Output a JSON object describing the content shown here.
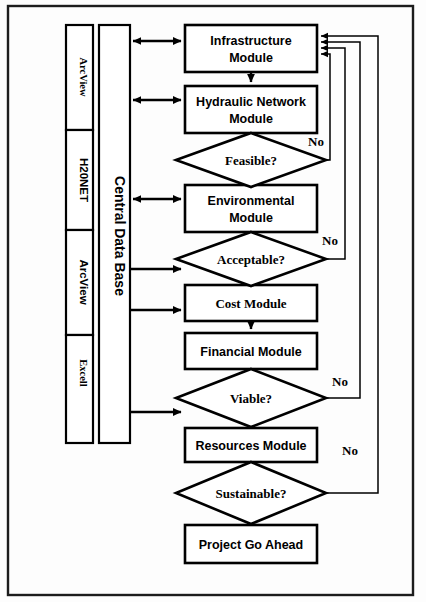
{
  "diagram": {
    "background": "#fdfdfd",
    "border_color": "#1c1c1c",
    "shape_fill": "#ffffff",
    "shape_stroke": "#000000"
  },
  "data_store": {
    "label": "Central Data Base",
    "software": [
      {
        "name": "ArcView"
      },
      {
        "name": "H20NET"
      },
      {
        "name": "ArcView"
      },
      {
        "name": "Excell"
      }
    ]
  },
  "process_boxes": [
    {
      "id": "infrastructure",
      "line1": "Infrastructure",
      "line2": "Module",
      "font": "sans"
    },
    {
      "id": "hydraulic",
      "line1": "Hydraulic Network",
      "line2": "Module",
      "font": "sans"
    },
    {
      "id": "environmental",
      "line1": "Environmental",
      "line2": "Module",
      "font": "sans"
    },
    {
      "id": "cost",
      "line1": "Cost Module",
      "line2": "",
      "font": "serif"
    },
    {
      "id": "financial",
      "line1": "Financial Module",
      "line2": "",
      "font": "sans"
    },
    {
      "id": "resources",
      "line1": "Resources Module",
      "line2": "",
      "font": "sans"
    },
    {
      "id": "goahead",
      "line1": "Project Go Ahead",
      "line2": "",
      "font": "sans"
    }
  ],
  "decisions": [
    {
      "id": "feasible",
      "label": "Feasible?",
      "no_label": "No"
    },
    {
      "id": "acceptable",
      "label": "Acceptable?",
      "no_label": "No"
    },
    {
      "id": "viable",
      "label": "Viable?",
      "no_label": "No"
    },
    {
      "id": "sustainable",
      "label": "Sustainable?",
      "no_label": "No"
    }
  ],
  "connections": {
    "bidirectional_to_db": [
      "infrastructure",
      "hydraulic",
      "environmental"
    ],
    "unidirectional_from_db": [
      "cost",
      "financial",
      "resources"
    ],
    "feedback_to_infrastructure": [
      "feasible",
      "acceptable",
      "viable",
      "sustainable"
    ]
  }
}
